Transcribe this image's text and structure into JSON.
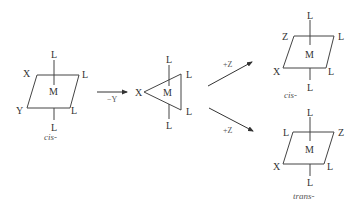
{
  "diagram": {
    "type": "reaction-mechanism",
    "reactant": {
      "geometry": "square-planar (octahedral projection)",
      "center": "M",
      "ligands": {
        "top": "L",
        "bottom": "L",
        "top_left": "X",
        "top_right": "L",
        "bottom_left": "Y",
        "bottom_right": "L"
      },
      "caption": "cis-"
    },
    "step1": {
      "label": "−Y"
    },
    "intermediate": {
      "geometry": "trigonal",
      "center": "M",
      "ligands": {
        "top": "L",
        "bottom": "L",
        "left": "X",
        "upper_right": "L",
        "lower_right": "L"
      }
    },
    "step2_upper": {
      "label": "+Z"
    },
    "step2_lower": {
      "label": "+Z"
    },
    "product_cis": {
      "center": "M",
      "ligands": {
        "top": "L",
        "bottom": "L",
        "top_left": "Z",
        "top_right": "L",
        "bottom_left": "X",
        "bottom_right": "L"
      },
      "caption": "cis-"
    },
    "product_trans": {
      "center": "M",
      "ligands": {
        "top": "L",
        "bottom": "L",
        "top_left": "L",
        "top_right": "Z",
        "bottom_left": "X",
        "bottom_right": "L"
      },
      "caption": "trans-"
    }
  }
}
